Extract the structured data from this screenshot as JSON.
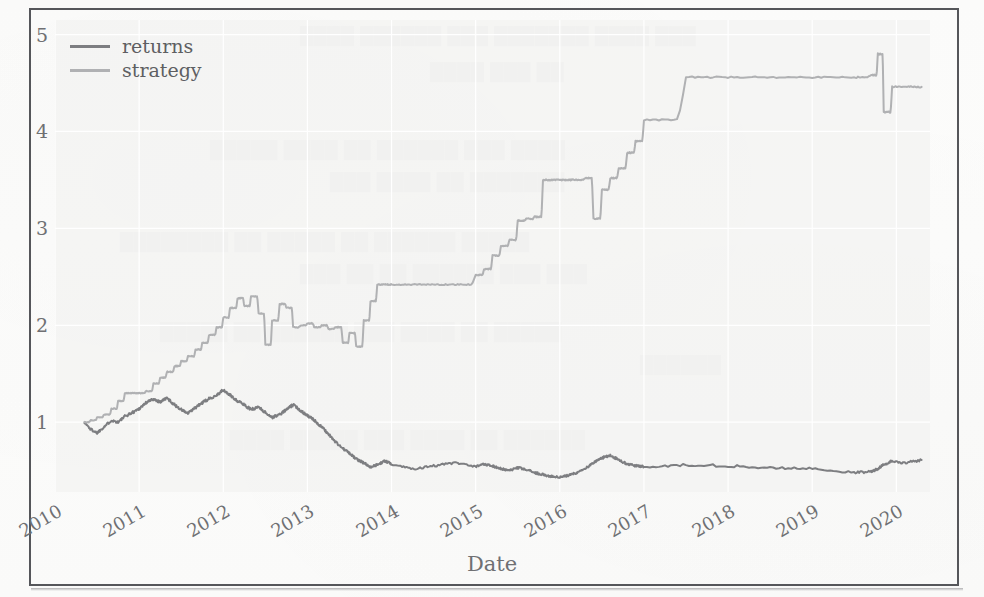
{
  "figure": {
    "background_color": "#f3f3f2",
    "paper_color": "#fbfbfa",
    "frame_color": "#55565a"
  },
  "legend": {
    "position": "upper-left",
    "entries": [
      {
        "label": "returns",
        "color": "#7d7e81",
        "icon": "line-swatch"
      },
      {
        "label": "strategy",
        "color": "#b0b1b3",
        "icon": "line-swatch"
      }
    ]
  },
  "axes": {
    "xlabel": "Date",
    "ylabel": "",
    "yticks": [
      "1",
      "2",
      "3",
      "4",
      "5"
    ],
    "xticks": [
      "2010",
      "2011",
      "2012",
      "2013",
      "2014",
      "2015",
      "2016",
      "2017",
      "2018",
      "2019",
      "2020"
    ],
    "grid": true
  },
  "chart_data": {
    "type": "line",
    "title": "",
    "xlabel": "Date",
    "ylabel": "",
    "xlim": [
      "2010",
      "2020.4"
    ],
    "ylim": [
      0.28,
      5.15
    ],
    "grid": true,
    "legend_position": "upper left",
    "x": [
      2010.35,
      2010.42,
      2010.5,
      2010.58,
      2010.67,
      2010.75,
      2010.83,
      2010.92,
      2011.0,
      2011.08,
      2011.17,
      2011.25,
      2011.33,
      2011.42,
      2011.5,
      2011.58,
      2011.67,
      2011.75,
      2011.83,
      2011.92,
      2012.0,
      2012.08,
      2012.17,
      2012.25,
      2012.33,
      2012.42,
      2012.5,
      2012.58,
      2012.67,
      2012.75,
      2012.83,
      2012.92,
      2013.0,
      2013.08,
      2013.17,
      2013.25,
      2013.33,
      2013.42,
      2013.5,
      2013.58,
      2013.67,
      2013.75,
      2013.83,
      2013.92,
      2014.0,
      2014.25,
      2014.5,
      2014.75,
      2015.0,
      2015.1,
      2015.2,
      2015.3,
      2015.4,
      2015.5,
      2015.6,
      2015.7,
      2015.8,
      2015.9,
      2016.0,
      2016.1,
      2016.2,
      2016.3,
      2016.4,
      2016.5,
      2016.6,
      2016.7,
      2016.8,
      2016.9,
      2017.0,
      2017.5,
      2018.0,
      2018.5,
      2019.0,
      2019.5,
      2019.7,
      2019.78,
      2019.85,
      2019.95,
      2020.1,
      2020.3
    ],
    "series": [
      {
        "name": "returns",
        "color": "#7d7e81",
        "linewidth": 2.0,
        "values": [
          1.0,
          0.93,
          0.89,
          0.95,
          1.02,
          1.0,
          1.06,
          1.1,
          1.14,
          1.2,
          1.24,
          1.21,
          1.25,
          1.18,
          1.13,
          1.09,
          1.15,
          1.2,
          1.24,
          1.28,
          1.33,
          1.28,
          1.22,
          1.18,
          1.13,
          1.16,
          1.1,
          1.05,
          1.08,
          1.13,
          1.18,
          1.12,
          1.07,
          1.02,
          0.95,
          0.88,
          0.8,
          0.73,
          0.68,
          0.62,
          0.58,
          0.54,
          0.56,
          0.6,
          0.57,
          0.52,
          0.55,
          0.58,
          0.54,
          0.57,
          0.55,
          0.52,
          0.5,
          0.53,
          0.51,
          0.48,
          0.46,
          0.44,
          0.43,
          0.45,
          0.48,
          0.52,
          0.58,
          0.63,
          0.66,
          0.61,
          0.57,
          0.55,
          0.54,
          0.56,
          0.55,
          0.53,
          0.52,
          0.48,
          0.49,
          0.52,
          0.56,
          0.6,
          0.58,
          0.61
        ],
        "description": "Buy-and-hold cumulative returns: rises to ~1.35 by early 2012, then declines through 2013 and oscillates between 0.43 and 0.66 through 2020."
      },
      {
        "name": "strategy",
        "color": "#b0b1b3",
        "linewidth": 2.0,
        "step_like": true,
        "values": [
          1.0,
          1.02,
          1.05,
          1.08,
          1.14,
          1.22,
          1.3,
          1.3,
          1.3,
          1.32,
          1.4,
          1.46,
          1.52,
          1.58,
          1.63,
          1.68,
          1.75,
          1.82,
          1.9,
          1.98,
          2.08,
          2.18,
          2.28,
          2.2,
          2.3,
          2.12,
          1.8,
          2.05,
          2.22,
          2.18,
          1.98,
          2.0,
          2.02,
          1.98,
          2.0,
          1.96,
          1.98,
          1.82,
          1.92,
          1.78,
          2.05,
          2.25,
          2.42,
          2.42,
          2.42,
          2.42,
          2.42,
          2.42,
          2.52,
          2.58,
          2.72,
          2.82,
          2.88,
          3.08,
          3.1,
          3.12,
          3.5,
          3.5,
          3.5,
          3.5,
          3.5,
          3.52,
          3.1,
          3.4,
          3.52,
          3.62,
          3.78,
          3.9,
          4.12,
          4.56,
          4.56,
          4.56,
          4.56,
          4.56,
          4.58,
          4.8,
          4.2,
          4.46,
          4.46,
          4.46
        ],
        "description": "Strategy cumulative returns: step-wise climb from 1.0 to a 4.56 plateau held from 2017 to late 2019, with a sharp spike to 4.8 and dip to 4.2 near 2019-2020, ending at 4.46."
      }
    ]
  }
}
